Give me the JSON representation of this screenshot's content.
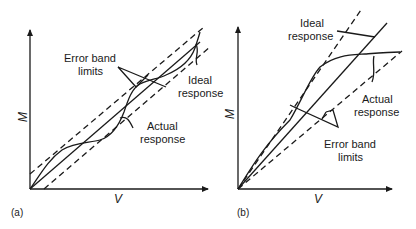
{
  "panels": [
    {
      "caption": "(a)",
      "x_axis_label": "V",
      "y_axis_label": "M",
      "labels": {
        "error_band": [
          "Error band",
          "limits"
        ],
        "ideal": [
          "Ideal",
          "response"
        ],
        "actual": [
          "Actual",
          "response"
        ]
      }
    },
    {
      "caption": "(b)",
      "x_axis_label": "V",
      "y_axis_label": "M",
      "labels": {
        "ideal": [
          "Ideal",
          "response"
        ],
        "actual": [
          "Actual",
          "response"
        ],
        "error_band": [
          "Error band",
          "limits"
        ]
      }
    }
  ],
  "colors": {
    "ink": "#1a1a1a",
    "background": "#ffffff"
  }
}
